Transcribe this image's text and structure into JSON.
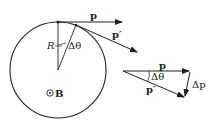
{
  "diagram": {
    "labels": {
      "p_top": "p",
      "p_prime_top": "p′",
      "radius": "R",
      "delta_theta_circle": "Δθ",
      "field": "B",
      "p_tri": "p",
      "p_prime_tri": "p′",
      "delta_theta_tri": "Δθ",
      "delta_p": "Δp"
    },
    "colors": {
      "stroke": "#222222"
    }
  }
}
